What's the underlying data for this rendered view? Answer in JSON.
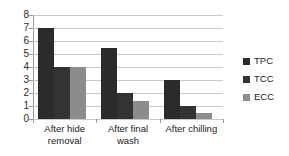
{
  "chart_data": {
    "type": "bar",
    "title": "",
    "xlabel": "",
    "ylabel": "",
    "ylim": [
      0,
      8
    ],
    "yticks": [
      "0",
      "1",
      "2",
      "3",
      "4",
      "5",
      "6",
      "7",
      "8"
    ],
    "grid": true,
    "legend_position": "right",
    "categories": [
      "After hide removal",
      "After final wash",
      "After chilling"
    ],
    "series": [
      {
        "name": "TPC",
        "color": "#2b2b2b",
        "values": [
          7.0,
          5.5,
          3.0
        ]
      },
      {
        "name": "TCC",
        "color": "#333333",
        "values": [
          4.0,
          2.0,
          1.0
        ]
      },
      {
        "name": "ECC",
        "color": "#8c8c8c",
        "values": [
          4.0,
          1.4,
          0.45
        ]
      }
    ]
  },
  "axis": {
    "y_tick_labels": [
      "8",
      "7",
      "6",
      "5",
      "4",
      "3",
      "2",
      "1",
      "0"
    ]
  },
  "categories_display": [
    {
      "line1": "After hide",
      "line2": "removal"
    },
    {
      "line1": "After final",
      "line2": "wash"
    },
    {
      "line1": "After chilling",
      "line2": ""
    }
  ],
  "legend": {
    "items": [
      {
        "label": "TPC",
        "color": "#2b2b2b"
      },
      {
        "label": "TCC",
        "color": "#333333"
      },
      {
        "label": "ECC",
        "color": "#8c8c8c"
      }
    ]
  }
}
